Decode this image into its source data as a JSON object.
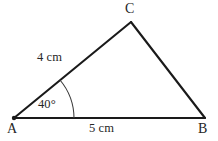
{
  "figure": {
    "type": "geometry-triangle-diagram",
    "background_color": "#ffffff",
    "stroke_color": "#1a1a1a",
    "text_color": "#262626",
    "width": 218,
    "height": 141
  },
  "vertices": [
    {
      "id": "A",
      "label": "A",
      "x": 14,
      "y": 118
    },
    {
      "id": "B",
      "label": "B",
      "x": 205,
      "y": 118
    },
    {
      "id": "C",
      "label": "C",
      "x": 131,
      "y": 22
    }
  ],
  "sides": [
    {
      "id": "AC",
      "from": "A",
      "to": "C",
      "label": "4 cm",
      "length_value": 4,
      "unit": "cm"
    },
    {
      "id": "AB",
      "from": "A",
      "to": "B",
      "label": "5 cm",
      "length_value": 5,
      "unit": "cm"
    },
    {
      "id": "CB",
      "from": "C",
      "to": "B",
      "label": "",
      "length_value": null,
      "unit": ""
    }
  ],
  "angles": [
    {
      "id": "angle-A",
      "at_vertex": "A",
      "label": "40°",
      "value": 40,
      "unit": "degrees",
      "arc_radius": 60
    }
  ],
  "tick_marks": [
    {
      "id": "angle-arc-tick",
      "on_side": "AB",
      "x": 73,
      "y": 118
    }
  ]
}
